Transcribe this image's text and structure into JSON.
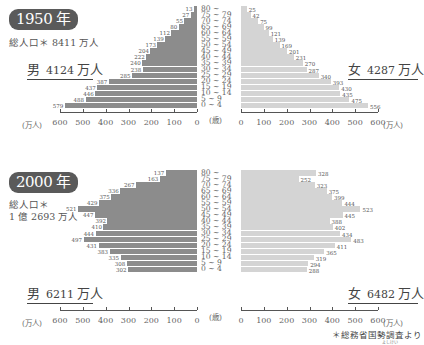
{
  "chart_data": [
    {
      "type": "bar",
      "title": "1950年",
      "subtitle": "総人口* 8411 万人",
      "xlabel": "(万人)",
      "ylabel": "(歳)",
      "categories": [
        "80 ~",
        "75 ~ 79",
        "70 ~ 74",
        "65 ~ 69",
        "60 ~ 64",
        "55 ~ 59",
        "50 ~ 54",
        "45 ~ 49",
        "40 ~ 44",
        "35 ~ 39",
        "30 ~ 34",
        "25 ~ 29",
        "20 ~ 24",
        "15 ~ 19",
        "10 ~ 14",
        "5 ~ 9",
        "0 ~ 4"
      ],
      "series": [
        {
          "name": "男",
          "total": "4124 万人",
          "values": [
            13,
            27,
            55,
            80,
            112,
            139,
            173,
            204,
            222,
            240,
            238,
            285,
            387,
            437,
            446,
            488,
            579
          ]
        },
        {
          "name": "女",
          "total": "4287 万人",
          "values": [
            25,
            42,
            75,
            99,
            121,
            139,
            169,
            201,
            231,
            270,
            287,
            340,
            393,
            430,
            435,
            475,
            556
          ]
        }
      ],
      "xlim": [
        0,
        600
      ],
      "xticks": [
        600,
        500,
        400,
        300,
        200,
        100,
        0
      ],
      "grid": false,
      "legend_position": "none"
    },
    {
      "type": "bar",
      "title": "2000年",
      "subtitle": "総人口* 1億 2693 万人",
      "xlabel": "(万人)",
      "ylabel": "(歳)",
      "categories": [
        "80 ~",
        "75 ~ 79",
        "70 ~ 74",
        "65 ~ 69",
        "60 ~ 64",
        "55 ~ 59",
        "50 ~ 54",
        "45 ~ 49",
        "40 ~ 44",
        "35 ~ 39",
        "30 ~ 34",
        "25 ~ 29",
        "20 ~ 24",
        "15 ~ 19",
        "10 ~ 14",
        "5 ~ 9",
        "0 ~ 4"
      ],
      "series": [
        {
          "name": "男",
          "total": "6211 万人",
          "values": [
            137,
            163,
            267,
            336,
            375,
            429,
            521,
            447,
            392,
            410,
            444,
            497,
            431,
            383,
            335,
            308,
            302
          ]
        },
        {
          "name": "女",
          "total": "6482 万人",
          "values": [
            328,
            252,
            323,
            375,
            399,
            444,
            523,
            445,
            388,
            402,
            434,
            483,
            411,
            365,
            319,
            294,
            288
          ]
        }
      ],
      "xlim": [
        0,
        600
      ],
      "xticks": [
        600,
        500,
        400,
        300,
        200,
        100,
        0
      ],
      "grid": false,
      "legend_position": "none"
    }
  ],
  "charts": [
    {
      "year": "1950 年",
      "total_lines": [
        "総人口＊ 8411 万人"
      ],
      "male": {
        "label": "男",
        "num": "4124",
        "unit": "万人"
      },
      "female": {
        "label": "女",
        "num": "4287",
        "unit": "万人"
      }
    },
    {
      "year": "2000 年",
      "total_lines": [
        "総人口＊",
        "1 億 2693 万人"
      ],
      "male": {
        "label": "男",
        "num": "6211",
        "unit": "万人"
      },
      "female": {
        "label": "女",
        "num": "6482",
        "unit": "万人"
      }
    }
  ],
  "axis": {
    "unit": "(万人)",
    "age_unit": "(歳)",
    "ticks_left": [
      "600",
      "500",
      "400",
      "300",
      "200",
      "100",
      "0"
    ],
    "ticks_right": [
      "0",
      "100",
      "200",
      "300",
      "400",
      "500",
      "600"
    ]
  },
  "source": {
    "text": "＊総務省国勢調査より",
    "ruby": "よしけい"
  },
  "colors": {
    "male_bar": "#8c8c8c",
    "female_bar": "#d4d4d4",
    "badge": "#5a5a5a"
  }
}
